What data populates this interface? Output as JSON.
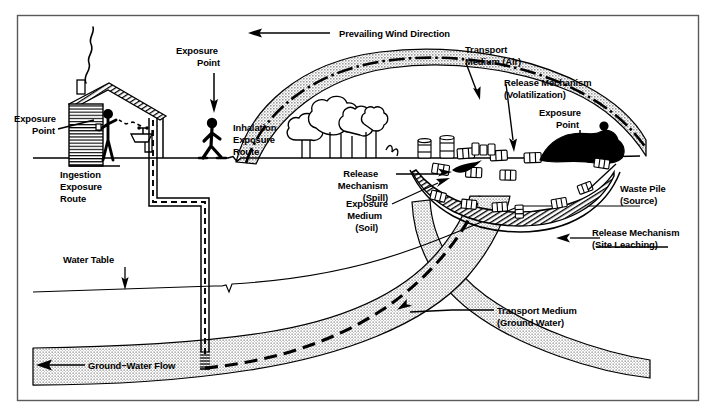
{
  "figure": {
    "frame_color": "#555555",
    "ink_color": "#000000",
    "plume_fill": "#c9c9c9",
    "background": "#ffffff"
  },
  "labels": {
    "prevailing_wind": "Prevailing Wind Direction",
    "exposure_point_house": "Exposure\nPoint",
    "exposure_point_house_l1": "Exposure",
    "exposure_point_house_l2": "Point",
    "ingestion_route_l1": "Ingestion",
    "ingestion_route_l2": "Exposure",
    "ingestion_route_l3": "Route",
    "exposure_point_walker_l1": "Exposure",
    "exposure_point_walker_l2": "Point",
    "inhalation_route_l1": "Inhalation",
    "inhalation_route_l2": "Exposure",
    "inhalation_route_l3": "Route",
    "transport_air_l1": "Transport",
    "transport_air_l2": "Medium (Air)",
    "release_volatilization_l1": "Release Mechanism",
    "release_volatilization_l2": "(Volatilization)",
    "exposure_point_worker_l1": "Exposure",
    "exposure_point_worker_l2": "Point",
    "waste_pile_l1": "Waste Pile",
    "waste_pile_l2": "(Source)",
    "release_spill_l1": "Release",
    "release_spill_l2": "Mechanism",
    "release_spill_l3": "(Spill)",
    "exposure_medium_soil_l1": "Exposure",
    "exposure_medium_soil_l2": "Medium",
    "exposure_medium_soil_l3": "(Soil)",
    "release_leaching_l1": "Release Mechanism",
    "release_leaching_l2": "(Site Leaching)",
    "transport_groundwater_l1": "Transport Medium",
    "transport_groundwater_l2": "(Ground Water)",
    "water_table": "Water Table",
    "ground_water_flow": "Ground−Water Flow"
  },
  "icons": {
    "house": "house-icon",
    "chimney_smoke": "smoke-icon",
    "person_drinking": "person-drinking-icon",
    "sink": "sink-faucet-icon",
    "well": "water-well-icon",
    "person_walking": "person-walking-icon",
    "trees": "trees-icon",
    "drums": "waste-drums-icon",
    "waste_pile": "waste-pile-icon",
    "person_shoveling": "person-shoveling-icon",
    "wind_arrow": "left-arrow-icon",
    "groundwater_arrow": "left-arrow-icon"
  },
  "pathways": [
    {
      "name": "air",
      "medium": "Air",
      "release": "Volatilization",
      "route": "Inhalation",
      "receptor": "walker"
    },
    {
      "name": "soil",
      "medium": "Soil",
      "release": "Spill",
      "route": "Dermal/Ingestion",
      "receptor": "worker"
    },
    {
      "name": "groundwater",
      "medium": "Ground Water",
      "release": "Site Leaching",
      "route": "Ingestion",
      "receptor": "resident"
    }
  ]
}
